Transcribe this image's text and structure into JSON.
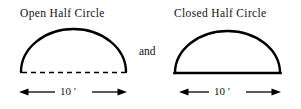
{
  "figure": {
    "background_color": "#ffffff",
    "ink_color": "#000000",
    "conjunction": "and",
    "shapes": [
      {
        "id": "open-half-circle",
        "caption": "Open Half Circle",
        "base_style": "dashed",
        "arc_style": "solid",
        "dimension_label": "10 ′",
        "dimension_value": "10",
        "dimension_unit": "′",
        "span_left_x": 21,
        "span_right_x": 126,
        "baseline_y": 72,
        "apex_y": 29
      },
      {
        "id": "closed-half-circle",
        "caption": "Closed Half Circle",
        "base_style": "solid",
        "arc_style": "solid",
        "dimension_label": "10 ′",
        "dimension_value": "10",
        "dimension_unit": "′",
        "span_left_x": 175,
        "span_right_x": 280,
        "baseline_y": 73,
        "apex_y": 31
      }
    ]
  }
}
